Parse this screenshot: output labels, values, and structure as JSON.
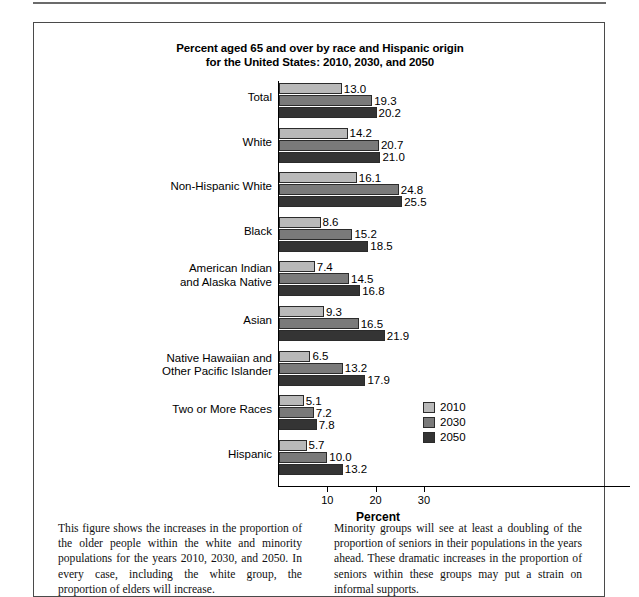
{
  "figure": {
    "title_line1": "Percent aged 65 and over by race and Hispanic origin",
    "title_line2": "for the United States: 2010, 2030, and 2050"
  },
  "chart_data": {
    "type": "bar",
    "orientation": "horizontal",
    "title": "Percent aged 65 and over by race and Hispanic origin for the United States: 2010, 2030, and 2050",
    "xlabel": "Percent",
    "ylabel": "",
    "xlim": [
      0,
      36
    ],
    "xticks": [
      10,
      20,
      30
    ],
    "xticklabels": [
      "10",
      "20",
      "30"
    ],
    "grid": false,
    "legend_position": "inside-lower-right",
    "categories": [
      "Total",
      "White",
      "Non-Hispanic White",
      "Black",
      "American Indian\nand Alaska Native",
      "Asian",
      "Native Hawaiian and\nOther Pacific Islander",
      "Two or More Races",
      "Hispanic"
    ],
    "series": [
      {
        "name": "2010",
        "color": "#b9b9b9",
        "values": [
          13.0,
          14.2,
          16.1,
          8.6,
          7.4,
          9.3,
          6.5,
          5.1,
          5.7
        ]
      },
      {
        "name": "2030",
        "color": "#7a7a7a",
        "values": [
          19.3,
          20.7,
          24.8,
          15.2,
          14.5,
          16.5,
          13.2,
          7.2,
          10.0
        ]
      },
      {
        "name": "2050",
        "color": "#343434",
        "values": [
          20.2,
          21.0,
          25.5,
          18.5,
          16.8,
          21.9,
          17.9,
          7.8,
          13.2
        ]
      }
    ],
    "value_label_format": "one-decimal"
  },
  "categories_display": [
    {
      "lines": [
        "Total"
      ]
    },
    {
      "lines": [
        "White"
      ]
    },
    {
      "lines": [
        "Non-Hispanic White"
      ]
    },
    {
      "lines": [
        "Black"
      ]
    },
    {
      "lines": [
        "American Indian",
        "and Alaska Native"
      ]
    },
    {
      "lines": [
        "Asian"
      ]
    },
    {
      "lines": [
        "Native Hawaiian and",
        "Other Pacific Islander"
      ]
    },
    {
      "lines": [
        "Two or More Races"
      ]
    },
    {
      "lines": [
        "Hispanic"
      ]
    }
  ],
  "legend": {
    "items": [
      {
        "label": "2010",
        "swatch": "b2010"
      },
      {
        "label": "2030",
        "swatch": "b2030"
      },
      {
        "label": "2050",
        "swatch": "b2050"
      }
    ]
  },
  "caption": {
    "left": "This figure shows the increases in the proportion of the older people within the white and minority populations for the years 2010, 2030, and 2050. In every case, including the white group, the proportion of elders will increase.",
    "right": "Minority groups will see at least a doubling of the proportion of seniors in their populations in the years ahead. These dramatic increases in the proportion of seniors within these groups may put a strain on informal supports."
  }
}
